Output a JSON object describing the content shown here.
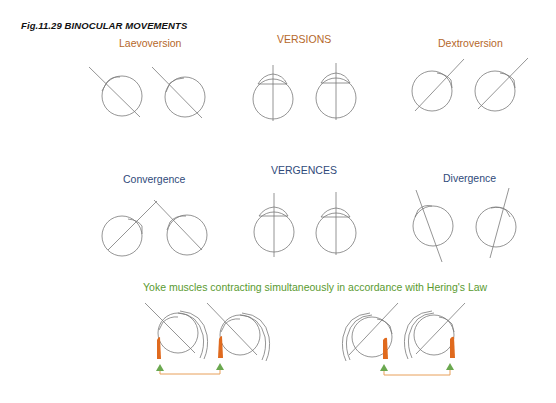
{
  "figure": {
    "title": "Fig.11.29  BINOCULAR MOVEMENTS"
  },
  "versions": {
    "heading": "VERSIONS",
    "left_label": "Laevoversion",
    "right_label": "Dextroversion"
  },
  "vergences": {
    "heading": "VERGENCES",
    "left_label": "Convergence",
    "right_label": "Divergence"
  },
  "yoke": {
    "caption": "Yoke muscles contracting simultaneously in accordance with Hering's Law"
  },
  "colors": {
    "versions_text": "#b5672a",
    "vergences_text": "#2f4a7a",
    "yoke_text": "#5a9a30",
    "muscle": "#e06a1e",
    "arrow": "#6aa84f",
    "connector": "#e8a05a",
    "line": "#777777"
  }
}
